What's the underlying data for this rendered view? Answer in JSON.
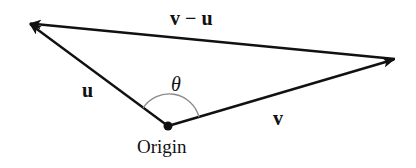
{
  "diagram": {
    "colors": {
      "line": "#111111",
      "arc": "#8a8a8a",
      "background": "#ffffff"
    },
    "points": {
      "origin": {
        "x": 168,
        "y": 126
      },
      "u_tip": {
        "x": 29,
        "y": 23
      },
      "v_tip": {
        "x": 395,
        "y": 59
      }
    },
    "labels": {
      "difference_vector": "v − u",
      "vector_u": "u",
      "vector_v": "v",
      "angle": "θ",
      "origin": "Origin"
    }
  }
}
